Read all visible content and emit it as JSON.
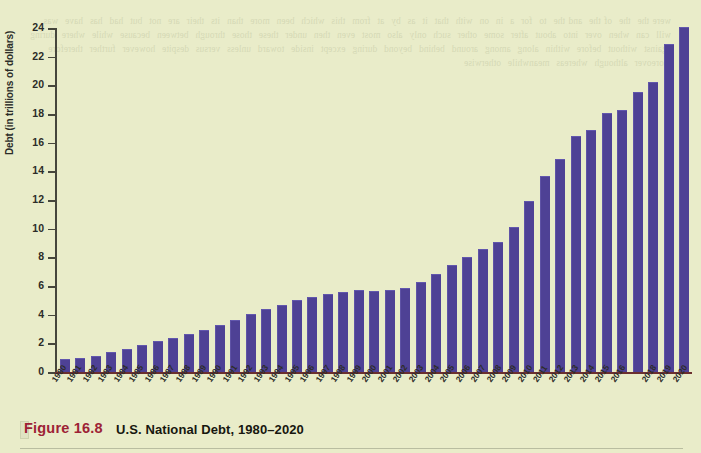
{
  "figure": {
    "number_label": "Figure 16.8",
    "title": "U.S. National Debt, 1980–2020",
    "accent_color": "#9d2235",
    "background_color": "#e9ecc9",
    "bar_color": "#4e4195"
  },
  "bleed_text": "were the  the  of the  and the  to  for  a  in  on  with  that  it  as  by  at  from  this  which  been  more  than  its  their  are  not  but  had  has  have  was  will  can  when  over  into  about  after  some  other  such  only  also  most  even  then  under  these  those  through  between  because  while  where  during  against  without  before  within  along  among  around  behind  beyond  during  except  inside  toward  unless  versus  despite  however  further  therefore  moreover  although  whereas  meanwhile  otherwise",
  "chart_data": {
    "type": "bar",
    "title": "U.S. National Debt, 1980–2020",
    "xlabel": "",
    "ylabel": "Debt (in trillions of dollars)",
    "ylim": [
      0,
      24
    ],
    "ytick_step": 2,
    "yticks": [
      24,
      22,
      20,
      18,
      16,
      14,
      12,
      10,
      8,
      6,
      4,
      2,
      0
    ],
    "grid": false,
    "legend": null,
    "categories": [
      "1980",
      "1981",
      "1982",
      "1983",
      "1984",
      "1985",
      "1986",
      "1987",
      "1988",
      "1989",
      "1990",
      "1991",
      "1992",
      "1993",
      "1994",
      "1995",
      "1996",
      "1997",
      "1998",
      "1999",
      "2000",
      "2001",
      "2002",
      "2003",
      "2004",
      "2005",
      "2006",
      "2007",
      "2008",
      "2009",
      "2010",
      "2011",
      "2012",
      "2013",
      "2014",
      "2015",
      "2016",
      "2017",
      "2018",
      "2019",
      "2020"
    ],
    "tick_labels_shown": [
      "1980",
      "1981",
      "1982",
      "1983",
      "1984",
      "1985",
      "1986",
      "1987",
      "1988",
      "1989",
      "1990",
      "1991",
      "1992",
      "1993",
      "1994",
      "1995",
      "1996",
      "1997",
      "1998",
      "1999",
      "2000",
      "2001",
      "2002",
      "2003",
      "2004",
      "2005",
      "2006",
      "2007",
      "2008",
      "2009",
      "2010",
      "2011",
      "2012",
      "2013",
      "2014",
      "2015",
      "2016",
      "",
      "2018",
      "2019",
      "2020"
    ],
    "values": [
      0.9,
      1.0,
      1.15,
      1.4,
      1.6,
      1.85,
      2.15,
      2.35,
      2.65,
      2.9,
      3.25,
      3.65,
      4.05,
      4.4,
      4.7,
      5.0,
      5.25,
      5.45,
      5.55,
      5.7,
      5.65,
      5.75,
      5.85,
      6.25,
      6.85,
      7.45,
      8.0,
      8.55,
      9.05,
      10.1,
      11.9,
      13.65,
      14.85,
      16.5,
      16.85,
      18.05,
      18.3,
      19.55,
      20.2,
      22.9,
      24.1
    ],
    "units": "trillions of dollars"
  }
}
